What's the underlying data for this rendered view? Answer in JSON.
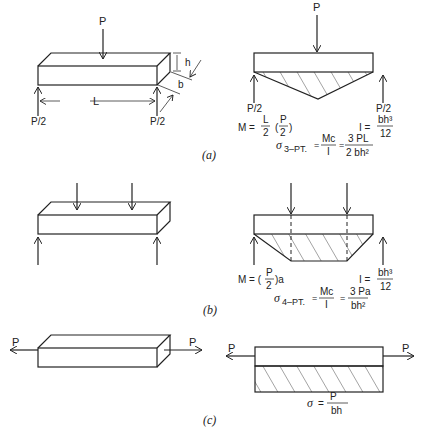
{
  "figure": {
    "panels": [
      {
        "id": "a",
        "caption": "(a)",
        "load_label": "P",
        "support_left": "P/2",
        "support_right": "P/2",
        "length_label": "L",
        "height_label": "h",
        "width_label": "b",
        "moment_eq": {
          "lhs": "M =",
          "frac1_num": "L",
          "frac1_den": "2",
          "frac2_num": "P",
          "frac2_den": "2"
        },
        "inertia_eq": {
          "lhs": "I =",
          "num": "bh³",
          "den": "12"
        },
        "stress_eq": {
          "sigma": "σ",
          "sub": "3–PT.",
          "eq1": "=",
          "frac1_num": "Mc",
          "frac1_den": "I",
          "eq2": "=",
          "frac2_num": "3 PL",
          "frac2_den": "2 bh²"
        },
        "diagram_type": "3-point bending, triangular moment diagram"
      },
      {
        "id": "b",
        "caption": "(b)",
        "moment_eq": {
          "lhs": "M = (",
          "frac_num": "P",
          "frac_den": "2",
          "rhs": ")a"
        },
        "inertia_eq": {
          "lhs": "I =",
          "num": "bh³",
          "den": "12"
        },
        "stress_eq": {
          "sigma": "σ",
          "sub": "4–PT.",
          "eq1": "=",
          "frac1_num": "Mc",
          "frac1_den": "I",
          "eq2": "=",
          "frac2_num": "3 Pa",
          "frac2_den": "bh²"
        },
        "diagram_type": "4-point bending, trapezoidal moment diagram"
      },
      {
        "id": "c",
        "caption": "(c)",
        "load_left": "P",
        "load_right": "P",
        "stress_eq": {
          "sigma": "σ",
          "eq": "=",
          "num": "P",
          "den": "bh"
        },
        "diagram_type": "uniaxial tension, uniform stress"
      }
    ]
  }
}
